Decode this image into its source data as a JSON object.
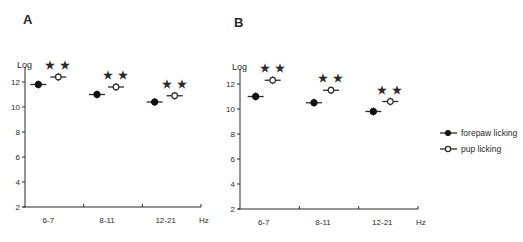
{
  "figure": {
    "legend": {
      "items": [
        {
          "label": "forepaw licking",
          "marker": "filled-circle"
        },
        {
          "label": "pup licking",
          "marker": "open-circle"
        }
      ]
    }
  },
  "chart_data": [
    {
      "panel": "A",
      "type": "scatter",
      "title": "",
      "xlabel": "Hz",
      "ylabel": "Log",
      "categories": [
        "6-7",
        "8-11",
        "12-21"
      ],
      "yticks": [
        2,
        4,
        6,
        8,
        10,
        12
      ],
      "ylim": [
        2,
        13
      ],
      "grid": false,
      "legend_position": "right",
      "series": [
        {
          "name": "forepaw licking",
          "marker": "filled",
          "values": [
            11.8,
            11.0,
            10.4
          ]
        },
        {
          "name": "pup licking",
          "marker": "open",
          "values": [
            12.4,
            11.6,
            10.9
          ]
        }
      ],
      "annotations": [
        {
          "category": "6-7",
          "text": "**"
        },
        {
          "category": "8-11",
          "text": "**"
        },
        {
          "category": "12-21",
          "text": "**"
        }
      ]
    },
    {
      "panel": "B",
      "type": "scatter",
      "title": "",
      "xlabel": "Hz",
      "ylabel": "Log",
      "categories": [
        "6-7",
        "8-11",
        "12-21"
      ],
      "yticks": [
        2,
        4,
        6,
        8,
        10,
        12
      ],
      "ylim": [
        2,
        13
      ],
      "grid": false,
      "legend_position": "right",
      "series": [
        {
          "name": "forepaw licking",
          "marker": "filled",
          "values": [
            11.0,
            10.5,
            9.8
          ]
        },
        {
          "name": "pup licking",
          "marker": "open",
          "values": [
            12.3,
            11.5,
            10.6
          ]
        }
      ],
      "annotations": [
        {
          "category": "6-7",
          "text": "**"
        },
        {
          "category": "8-11",
          "text": "**"
        },
        {
          "category": "12-21",
          "text": "**"
        }
      ]
    }
  ]
}
